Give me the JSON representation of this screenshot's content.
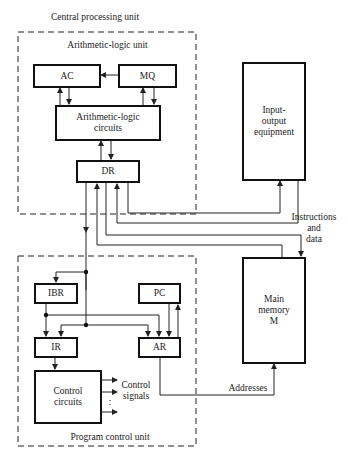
{
  "title": "Central processing unit",
  "cpu": {
    "label": "Central processing unit",
    "alu": {
      "label": "Arithmetic-logic unit",
      "registers": {
        "ac": "AC",
        "mq": "MQ",
        "alc_line1": "Arithmetic-logic",
        "alc_line2": "circuits",
        "dr": "DR"
      }
    },
    "program_control": {
      "label": "Program control unit",
      "registers": {
        "ibr": "IBR",
        "pc": "PC",
        "ir": "IR",
        "ar": "AR",
        "cc_line1": "Control",
        "cc_line2": "circuits"
      },
      "control_signals_line1": "Control",
      "control_signals_line2": "signals",
      "dots": ":"
    }
  },
  "io": {
    "line1": "Input-",
    "line2": "output",
    "line3": "equipment"
  },
  "memory": {
    "line1": "Main",
    "line2": "memory",
    "line3": "M"
  },
  "annotations": {
    "instr_line1": "Instructions",
    "instr_line2": "and",
    "instr_line3": "data",
    "addresses": "Addresses"
  },
  "colors": {
    "line": "#222222",
    "box_border": "#111111",
    "background": "#ffffff"
  }
}
